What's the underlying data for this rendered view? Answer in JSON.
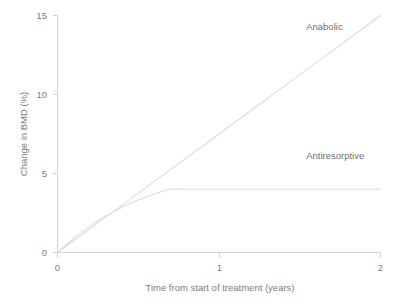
{
  "chart_data": {
    "type": "line",
    "title": "",
    "xlabel": "Time from start of treatment (years)",
    "ylabel": "Change in BMD (%)",
    "xlim": [
      0,
      2
    ],
    "ylim": [
      0,
      15
    ],
    "xticks": [
      "0",
      "1",
      "2"
    ],
    "xtick_values": [
      0,
      1,
      2
    ],
    "yticks": [
      "0",
      "5",
      "10",
      "15"
    ],
    "ytick_values": [
      0,
      5,
      10,
      15
    ],
    "grid": false,
    "legend_position": "inline-annotation",
    "series": [
      {
        "name": "Anabolic",
        "label": "Anabolic",
        "color": "#dcdcdc",
        "x": [
          0,
          0.2,
          0.4,
          0.6,
          0.8,
          1.0,
          1.2,
          1.4,
          1.6,
          1.8,
          2.0
        ],
        "values": [
          0,
          1.5,
          3.0,
          4.5,
          6.0,
          7.5,
          9.0,
          10.5,
          12.0,
          13.5,
          15.0
        ]
      },
      {
        "name": "Antiresorptive",
        "label": "Antiresorptive",
        "color": "#dcdcdc",
        "x": [
          0,
          0.1,
          0.2,
          0.3,
          0.4,
          0.5,
          0.6,
          0.7,
          0.8,
          0.9,
          1.0,
          1.2,
          1.4,
          1.6,
          1.8,
          2.0
        ],
        "values": [
          0,
          0.9,
          1.67,
          2.32,
          2.86,
          3.32,
          3.7,
          4.0,
          4.0,
          4.0,
          4.0,
          4.0,
          4.0,
          4.0,
          4.0,
          4.0
        ]
      }
    ],
    "annotations": [
      {
        "text": "Anabolic",
        "x": 1.54,
        "y": 14.1
      },
      {
        "text": "Antiresorptive",
        "x": 1.54,
        "y": 5.95
      }
    ]
  },
  "colors": {
    "background": "#ffffff",
    "axis": "#d4d4d4",
    "line": "#dcdcdc",
    "text": "#7d7d7d"
  }
}
